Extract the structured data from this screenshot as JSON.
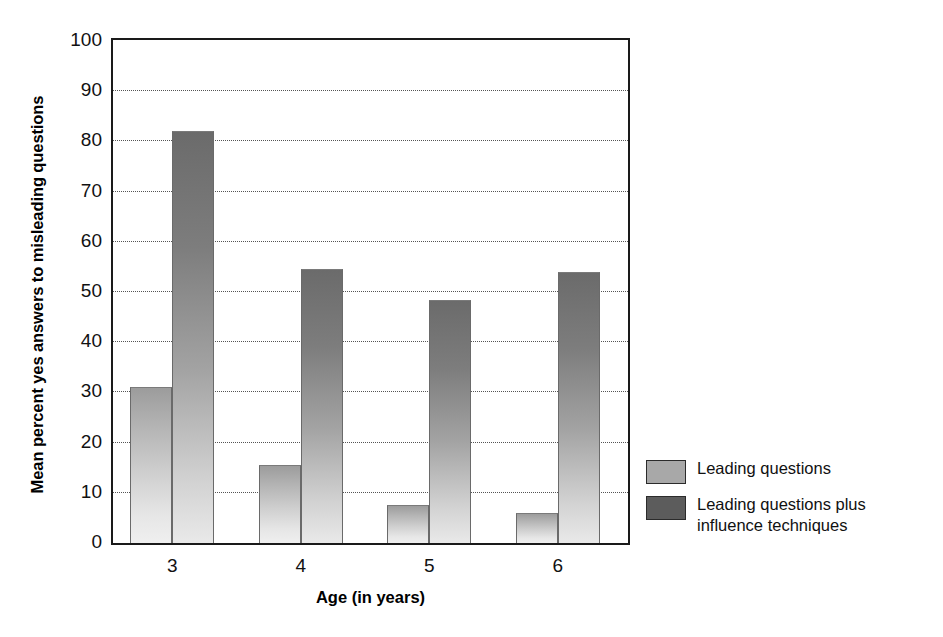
{
  "chart_data": {
    "type": "bar",
    "title": "",
    "xlabel": "Age (in years)",
    "ylabel": "Mean percent yes answers to misleading questions",
    "categories": [
      "3",
      "4",
      "5",
      "6"
    ],
    "ylim": [
      0,
      100
    ],
    "ytick_labels": [
      "0",
      "10",
      "20",
      "30",
      "40",
      "50",
      "60",
      "70",
      "80",
      "90",
      "100"
    ],
    "ytick_values": [
      0,
      10,
      20,
      30,
      40,
      50,
      60,
      70,
      80,
      90,
      100
    ],
    "grid": true,
    "grid_axis": "y",
    "grid_style": "dotted",
    "legend_position": "right",
    "series": [
      {
        "name": "Leading questions",
        "color": "#a8a8a8",
        "values": [
          31,
          15.5,
          7.5,
          6
        ]
      },
      {
        "name": "Leading questions plus influence techniques",
        "color": "#5c5c5c",
        "values": [
          82,
          54.5,
          48.5,
          54
        ]
      }
    ]
  },
  "legend": {
    "items": [
      {
        "label": "Leading questions",
        "swatch": "light"
      },
      {
        "label": "Leading questions plus influence techniques",
        "swatch": "dark"
      }
    ]
  }
}
